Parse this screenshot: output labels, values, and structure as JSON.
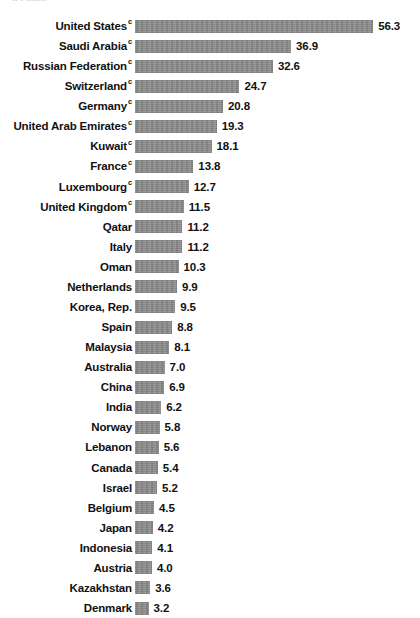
{
  "chart_data": {
    "type": "bar",
    "orientation": "horizontal",
    "title": "",
    "xlabel": "",
    "ylabel": "",
    "grid": false,
    "legend": null,
    "xlim": [
      0,
      56.3
    ],
    "value_format": "one-decimal",
    "sorted": "descending",
    "categories": [
      "United States",
      "Saudi Arabia",
      "Russian Federation",
      "Switzerland",
      "Germany",
      "United Arab Emirates",
      "Kuwait",
      "France",
      "Luxembourg",
      "United Kingdom",
      "Qatar",
      "Italy",
      "Oman",
      "Netherlands",
      "Korea, Rep.",
      "Spain",
      "Malaysia",
      "Australia",
      "China",
      "India",
      "Norway",
      "Lebanon",
      "Canada",
      "Israel",
      "Belgium",
      "Japan",
      "Indonesia",
      "Austria",
      "Kazakhstan",
      "Denmark"
    ],
    "values": [
      56.3,
      36.9,
      32.6,
      24.7,
      20.8,
      19.3,
      18.1,
      13.8,
      12.7,
      11.5,
      11.2,
      11.2,
      10.3,
      9.9,
      9.5,
      8.8,
      8.1,
      7.0,
      6.9,
      6.2,
      5.8,
      5.6,
      5.4,
      5.2,
      4.5,
      4.2,
      4.1,
      4.0,
      3.6,
      3.2
    ],
    "value_labels": [
      "56.3",
      "36.9",
      "32.6",
      "24.7",
      "20.8",
      "19.3",
      "18.1",
      "13.8",
      "12.7",
      "11.5",
      "11.2",
      "11.2",
      "10.3",
      "9.9",
      "9.5",
      "8.8",
      "8.1",
      "7.0",
      "6.9",
      "6.2",
      "5.8",
      "5.6",
      "5.4",
      "5.2",
      "4.5",
      "4.2",
      "4.1",
      "4.0",
      "3.6",
      "3.2"
    ],
    "footnote_markers": [
      "c",
      "c",
      "c",
      "c",
      "c",
      "c",
      "c",
      "c",
      "c",
      "c",
      "",
      "",
      "",
      "",
      "",
      "",
      "",
      "",
      "",
      "",
      "",
      "",
      "",
      "",
      "",
      "",
      "",
      "",
      "",
      ""
    ],
    "colors": {
      "bar": "#8c8c8c",
      "text": "#111111",
      "background": "#ffffff"
    }
  },
  "layout": {
    "bar_origin_x": 135,
    "px_per_unit": 4.23,
    "row_pitch": 20.07,
    "first_row_top": 16,
    "bar_height": 13,
    "value_gap": 5
  },
  "top_remnant": {
    "text": "•• •   •••••••"
  }
}
